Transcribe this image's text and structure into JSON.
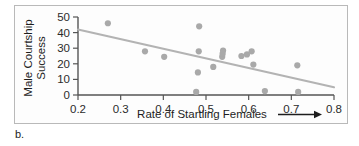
{
  "figure": {
    "caption": "b.",
    "frame_color": "#b9b9b9",
    "background": "#ffffff"
  },
  "chart_data": {
    "type": "scatter",
    "title": "",
    "xlabel": "Rate of Startling Females",
    "xlabel_arrow": "right-arrow",
    "ylabel_lines": [
      "Male Courtship",
      "Success"
    ],
    "ylabel": "Male Courtship Success",
    "xlim": [
      0.2,
      0.8
    ],
    "ylim": [
      0,
      50
    ],
    "xticks": [
      0.2,
      0.3,
      0.4,
      0.5,
      0.6,
      0.7,
      0.8
    ],
    "xtick_labels": [
      "0.2",
      "0.3",
      "0.4",
      "0.5",
      "0.6",
      "0.7",
      "0.8"
    ],
    "yticks": [
      0,
      10,
      20,
      30,
      40,
      50
    ],
    "ytick_labels": [
      "0",
      "10",
      "20",
      "30",
      "40",
      "50"
    ],
    "grid": false,
    "legend": null,
    "point_color": "#a9a9a9",
    "point_radius": 3.1,
    "points": [
      {
        "x": 0.27,
        "y": 46.0
      },
      {
        "x": 0.357,
        "y": 28.0
      },
      {
        "x": 0.402,
        "y": 24.5
      },
      {
        "x": 0.477,
        "y": 2.0
      },
      {
        "x": 0.481,
        "y": 14.5
      },
      {
        "x": 0.483,
        "y": 28.0
      },
      {
        "x": 0.484,
        "y": 44.0
      },
      {
        "x": 0.517,
        "y": 18.0
      },
      {
        "x": 0.538,
        "y": 24.5
      },
      {
        "x": 0.539,
        "y": 26.5
      },
      {
        "x": 0.54,
        "y": 28.5
      },
      {
        "x": 0.583,
        "y": 25.0
      },
      {
        "x": 0.596,
        "y": 26.0
      },
      {
        "x": 0.607,
        "y": 28.0
      },
      {
        "x": 0.611,
        "y": 19.5
      },
      {
        "x": 0.638,
        "y": 2.5
      },
      {
        "x": 0.714,
        "y": 19.0
      },
      {
        "x": 0.716,
        "y": 2.0
      }
    ],
    "trend_line": {
      "color": "#b3b3b3",
      "x_start": 0.2,
      "y_start": 42.0,
      "x_end": 0.8,
      "y_end": 5.0
    }
  }
}
